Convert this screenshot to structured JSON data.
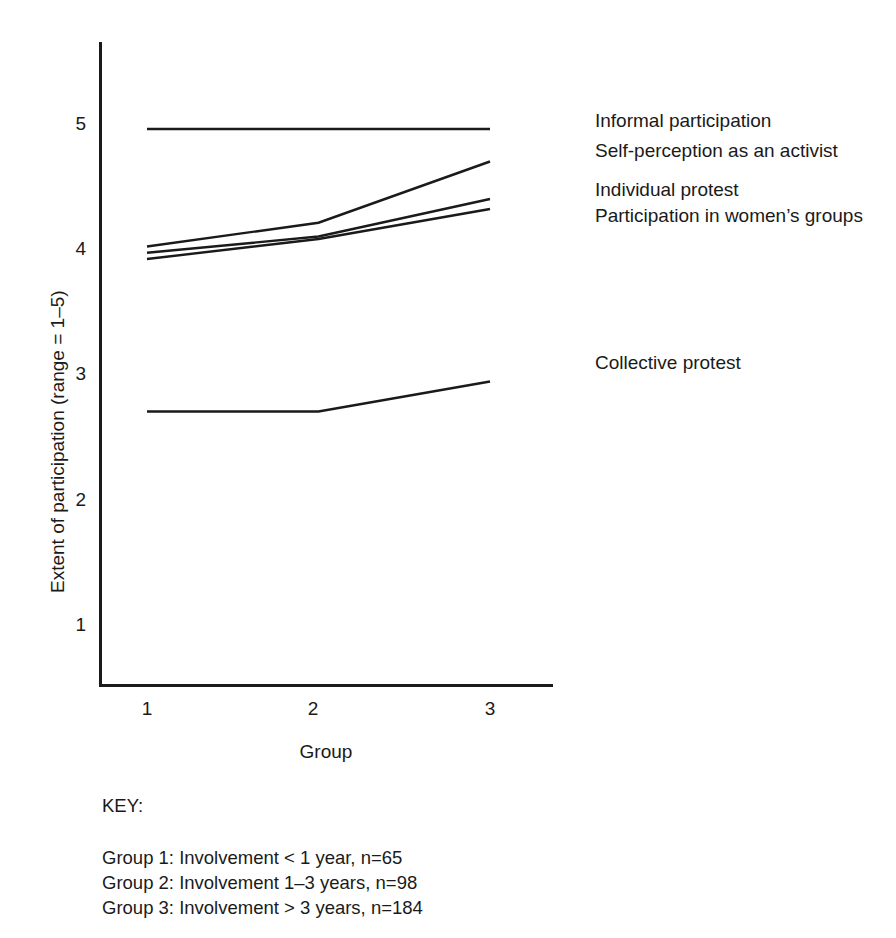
{
  "figure": {
    "top_fragment": "Figure 4.1  Participation by length of involvement",
    "ink_color": "#1a1a1a",
    "background": "#ffffff"
  },
  "axes": {
    "y_title": "Extent of participation (range = 1–5)",
    "x_title": "Group",
    "y_ticks": [
      "1",
      "2",
      "3",
      "4",
      "5"
    ],
    "x_ticks": [
      "1",
      "2",
      "3"
    ]
  },
  "series_labels": {
    "informal": "Informal participation",
    "self_perception": "Self-perception as an activist",
    "individual_protest": "Individual protest",
    "womens_groups": "Participation in women’s groups",
    "collective_protest": "Collective protest"
  },
  "key": {
    "title": "KEY:",
    "lines": [
      "Group 1: Involvement < 1 year, n=65",
      "Group 2: Involvement 1–3 years, n=98",
      "Group 3: Involvement > 3 years, n=184"
    ]
  },
  "chart_data": {
    "type": "line",
    "title": "Participation by length of involvement",
    "xlabel": "Group",
    "ylabel": "Extent of participation (range = 1–5)",
    "categories": [
      "1",
      "2",
      "3"
    ],
    "x": [
      1,
      2,
      3
    ],
    "xlim": [
      0.65,
      3.45
    ],
    "ylim": [
      0.55,
      5.5
    ],
    "yticks": [
      1,
      2,
      3,
      4,
      5
    ],
    "grid": false,
    "legend": "right-of-plot, text only (no markers)",
    "series": [
      {
        "name": "Informal participation",
        "values": [
          4.96,
          4.96,
          4.96
        ],
        "label_position": "top"
      },
      {
        "name": "Self-perception as an activist",
        "values": [
          4.02,
          4.21,
          4.7
        ],
        "label_position": "top"
      },
      {
        "name": "Individual protest",
        "values": [
          3.97,
          4.1,
          4.4
        ],
        "label_position": "middle"
      },
      {
        "name": "Participation in women’s groups",
        "values": [
          3.92,
          4.08,
          4.32
        ],
        "label_position": "middle"
      },
      {
        "name": "Collective protest",
        "values": [
          2.7,
          2.7,
          2.94
        ],
        "label_position": "lower"
      }
    ]
  }
}
